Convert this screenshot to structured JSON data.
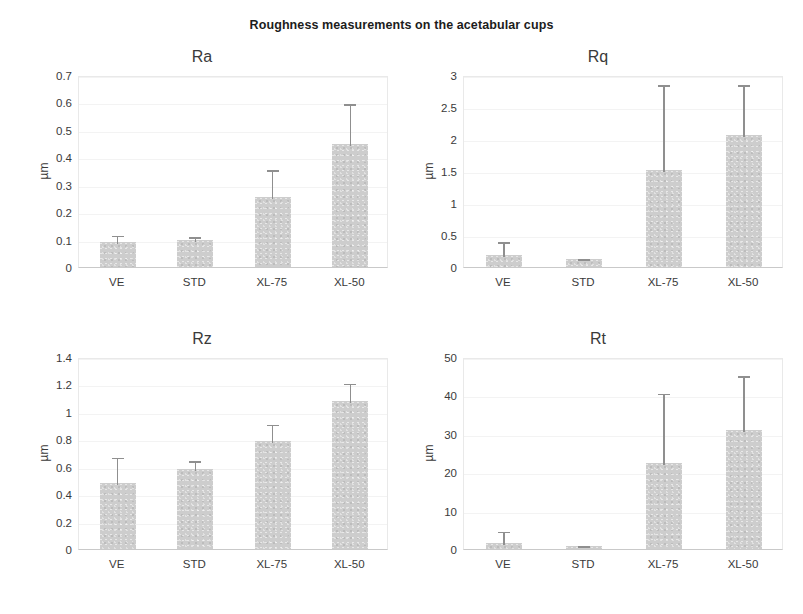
{
  "figure": {
    "title": "Roughness measurements on the acetabular cups",
    "background_color": "#ffffff",
    "bar_color": "#cdcdcd",
    "error_bar_color": "#8f8f8f",
    "axis_text_color": "#3a3a3a"
  },
  "chart_data": [
    {
      "type": "bar",
      "id": "ra",
      "title": "Ra",
      "xlabel": "",
      "ylabel": "µm",
      "categories": [
        "VE",
        "STD",
        "XL-75",
        "XL-50"
      ],
      "values": [
        0.09,
        0.1,
        0.255,
        0.45
      ],
      "errors_upper": [
        0.03,
        0.015,
        0.105,
        0.15
      ],
      "ylim": [
        0,
        0.7
      ],
      "yticks": [
        0,
        0.1,
        0.2,
        0.3,
        0.4,
        0.5,
        0.6,
        0.7
      ],
      "ytick_labels": [
        "0",
        "0.1",
        "0.2",
        "0.3",
        "0.4",
        "0.5",
        "0.6",
        "0.7"
      ],
      "grid": true,
      "legend": "none"
    },
    {
      "type": "bar",
      "id": "rq",
      "title": "Rq",
      "xlabel": "",
      "ylabel": "µm",
      "categories": [
        "VE",
        "STD",
        "XL-75",
        "XL-50"
      ],
      "values": [
        0.18,
        0.12,
        1.52,
        2.06
      ],
      "errors_upper": [
        0.24,
        0.03,
        1.35,
        0.81
      ],
      "ylim": [
        0,
        3
      ],
      "yticks": [
        0,
        0.5,
        1,
        1.5,
        2,
        2.5,
        3
      ],
      "ytick_labels": [
        "0",
        "0.5",
        "1",
        "1.5",
        "2",
        "2.5",
        "3"
      ],
      "grid": true,
      "legend": "none"
    },
    {
      "type": "bar",
      "id": "rz",
      "title": "Rz",
      "xlabel": "",
      "ylabel": "µm",
      "categories": [
        "VE",
        "STD",
        "XL-75",
        "XL-50"
      ],
      "values": [
        0.48,
        0.585,
        0.79,
        1.08
      ],
      "errors_upper": [
        0.2,
        0.07,
        0.13,
        0.14
      ],
      "ylim": [
        0,
        1.4
      ],
      "yticks": [
        0,
        0.2,
        0.4,
        0.6,
        0.8,
        1,
        1.2,
        1.4
      ],
      "ytick_labels": [
        "0",
        "0.2",
        "0.4",
        "0.6",
        "0.8",
        "1",
        "1.2",
        "1.4"
      ],
      "grid": true,
      "legend": "none"
    },
    {
      "type": "bar",
      "id": "rt",
      "title": "Rt",
      "xlabel": "",
      "ylabel": "µm",
      "categories": [
        "VE",
        "STD",
        "XL-75",
        "XL-50"
      ],
      "values": [
        1.5,
        0.8,
        22.5,
        31.0
      ],
      "errors_upper": [
        3.5,
        0.4,
        18.5,
        14.5
      ],
      "ylim": [
        0,
        50
      ],
      "yticks": [
        0,
        10,
        20,
        30,
        40,
        50
      ],
      "ytick_labels": [
        "0",
        "10",
        "20",
        "30",
        "40",
        "50"
      ],
      "grid": true,
      "legend": "none"
    }
  ]
}
